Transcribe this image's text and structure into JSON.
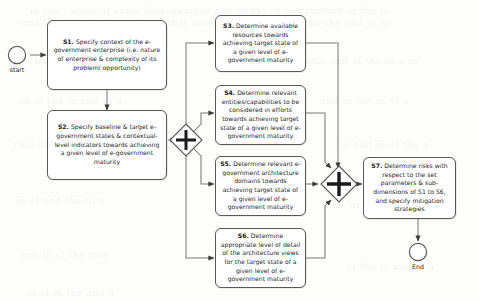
{
  "diagram": {
    "type": "bpmn-flowchart",
    "events": {
      "start": {
        "label": "start",
        "shape": "circle"
      },
      "end": {
        "label": "End",
        "shape": "circle"
      }
    },
    "gateways": [
      {
        "id": "split",
        "kind": "parallel-and",
        "symbol": "+"
      },
      {
        "id": "join",
        "kind": "parallel-and",
        "symbol": "+"
      }
    ],
    "tasks": [
      {
        "id": "S1",
        "code": "S1.",
        "text": "Specify context of the e-government enterprise (i.e. nature of enterprise & complexity of its problem/ opportunity)"
      },
      {
        "id": "S2",
        "code": "S2.",
        "text": "Specify baseline & target e-government states & contextual-level indicators towards achieving a given level of e-government maturity"
      },
      {
        "id": "S3",
        "code": "S3.",
        "text": "Determine available resources towards achieving target state of a given level of e-government maturity"
      },
      {
        "id": "S4",
        "code": "S4.",
        "text": "Determine relevant entities/capabilities to be considered in efforts towards achieving target state of a given level of e-government maturity"
      },
      {
        "id": "S5",
        "code": "S5.",
        "text": "Determine relevant e-government architecture domains towards achieving target state of a given level of e-government maturity"
      },
      {
        "id": "S6",
        "code": "S6.",
        "text": "Determine appropriate level of detail of the architecture views for the target state of a given level of e-government maturity"
      },
      {
        "id": "S7",
        "code": "S7.",
        "text": "Determine risks with respect to the set parameters & sub-dimensions of S1 to S6, and specify mitigation strategies"
      }
    ],
    "colors": {
      "stroke": "#585858",
      "text": "#1b1b1b",
      "background": "#fdfdfc"
    }
  },
  "background_bleed": [
    {
      "t": "in the , when of some dine-weather has on in",
      "x": 30,
      "y": 6
    },
    {
      "t": "to , of comparison in the to",
      "x": 250,
      "y": 6
    },
    {
      "t": "one are to indicate of these that to or",
      "x": 22,
      "y": 18
    },
    {
      "t": "in the of the the and to in",
      "x": 258,
      "y": 18
    },
    {
      "t": "the or and in that of a",
      "x": 30,
      "y": 56
    },
    {
      "t": "some and of the in a to",
      "x": 300,
      "y": 56
    },
    {
      "t": "an of the in and to a",
      "x": 18,
      "y": 96
    },
    {
      "t": "and to the in of a",
      "x": 320,
      "y": 96
    },
    {
      "t": "that of in the a and",
      "x": 14,
      "y": 140
    },
    {
      "t": "to and in of the a",
      "x": 340,
      "y": 140
    },
    {
      "t": "in of and the to a",
      "x": 16,
      "y": 196
    },
    {
      "t": "or of and in to the",
      "x": 350,
      "y": 200
    },
    {
      "t": "and in of the to a",
      "x": 20,
      "y": 250
    },
    {
      "t": "of the in and to a",
      "x": 346,
      "y": 262
    },
    {
      "t": "to of in the and a",
      "x": 26,
      "y": 288
    }
  ]
}
